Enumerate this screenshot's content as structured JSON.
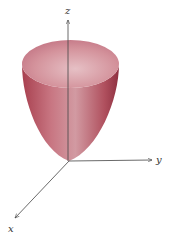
{
  "diagram": {
    "type": "3d-surface-paraboloid",
    "axes": {
      "x_label": "x",
      "y_label": "y",
      "z_label": "z"
    },
    "colors": {
      "surface_top": "#d88a94",
      "surface_side": "#b8505e",
      "surface_dark": "#8e3040",
      "axis": "#444444"
    }
  }
}
